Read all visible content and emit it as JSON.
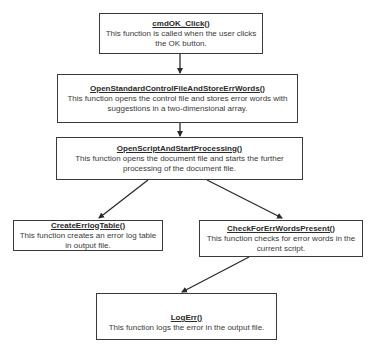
{
  "diagram": {
    "type": "flowchart",
    "nodes": [
      {
        "id": "b1",
        "title": "cmdOK_Click()",
        "desc_lines": [
          "This function is called when the user clicks",
          "the OK button."
        ]
      },
      {
        "id": "b2",
        "title": "OpenStandardControlFileAndStoreErrWords()",
        "desc_lines": [
          "This function opens the control file and stores error words with",
          "suggestions in a two-dimensional array."
        ]
      },
      {
        "id": "b3",
        "title": "OpenScriptAndStartProcessing()",
        "desc_lines": [
          "This function opens the document file and starts the further",
          "processing of the document file."
        ]
      },
      {
        "id": "b4",
        "title": "CreateErrlogTable()",
        "desc_lines": [
          "This function creates an error log table",
          "in output file."
        ]
      },
      {
        "id": "b5",
        "title": "CheckForErrWordsPresent()",
        "desc_lines": [
          "This function checks for error words in the",
          "current script."
        ]
      },
      {
        "id": "b6",
        "title": "LogErr()",
        "desc_lines": [
          "This function logs the error in the output file."
        ]
      }
    ],
    "edges": [
      {
        "from": "b1",
        "to": "b2"
      },
      {
        "from": "b2",
        "to": "b3"
      },
      {
        "from": "b3",
        "to": "b4"
      },
      {
        "from": "b3",
        "to": "b5"
      },
      {
        "from": "b5",
        "to": "b6"
      }
    ],
    "colors": {
      "line": "#3a3a3a",
      "background": "#ffffff",
      "text": "#333333"
    }
  }
}
